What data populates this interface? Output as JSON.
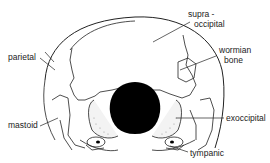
{
  "diagram": {
    "labels": {
      "supra_line1": "supra -",
      "supra_line2": "occipital",
      "wormian_line1": "wormian",
      "wormian_line2": "bone",
      "parietal": "parietal",
      "mastoid": "mastoid",
      "exoccipital": "exoccipital",
      "tympanic": "tympanic"
    },
    "colors": {
      "line": "#222222",
      "foramen": "#000000",
      "background": "#ffffff"
    }
  }
}
